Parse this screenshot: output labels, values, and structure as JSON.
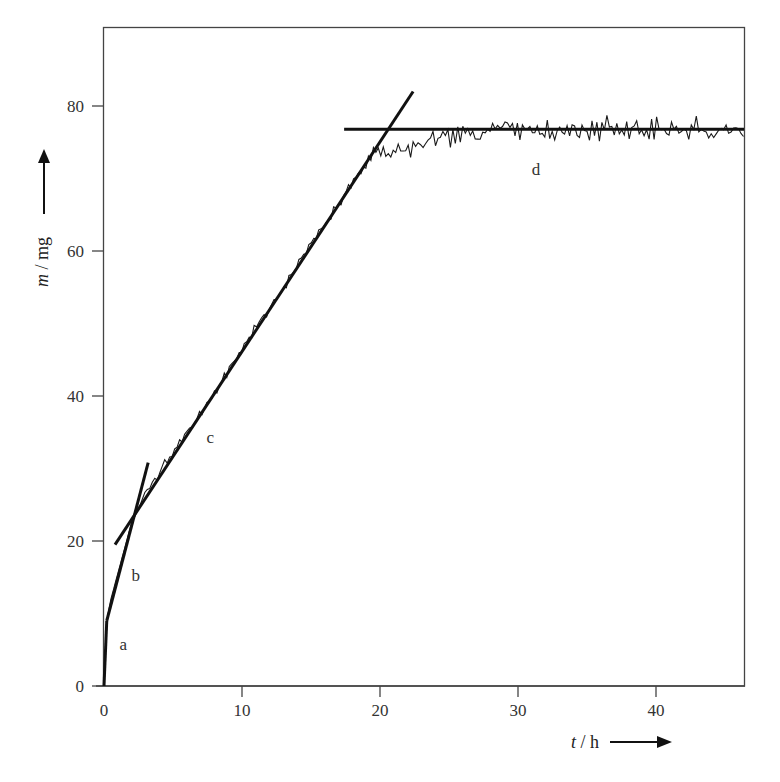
{
  "chart_data": {
    "type": "line",
    "title": "",
    "xlabel": "t / h",
    "ylabel": "m / mg",
    "xlabel_var": "t",
    "xlabel_unit": "h",
    "ylabel_var": "m",
    "ylabel_unit": "mg",
    "xlim": [
      0,
      46.4
    ],
    "ylim": [
      0,
      90.9
    ],
    "x_ticks": [
      0,
      10,
      20,
      30,
      40
    ],
    "y_ticks": [
      0,
      20,
      40,
      60,
      80
    ],
    "x_tick_labels": [
      "0",
      "10",
      "20",
      "30",
      "40"
    ],
    "y_tick_labels": [
      "0",
      "20",
      "40",
      "60",
      "80"
    ],
    "grid": false,
    "legend": null,
    "colors": {
      "line": "#1a1a1a",
      "axes": "#333333",
      "background": "#ffffff"
    },
    "series": [
      {
        "name": "measured mass (noisy)",
        "style": "thin",
        "description": "Noisy measured mass vs time: rapid rise (a), steep linear (b), linear ~2.9 mg/h (c), plateau ~76.7 mg (d)",
        "x": [
          0,
          0.2,
          0.5,
          1,
          1.5,
          2,
          2.5,
          3,
          4,
          5,
          6,
          7,
          8,
          9,
          10,
          11,
          12,
          13,
          14,
          15,
          16,
          17,
          18,
          19,
          19.5,
          20,
          21,
          22,
          23,
          24,
          25,
          26,
          27,
          28,
          30,
          32,
          34,
          36,
          38,
          40,
          42,
          44,
          46.4
        ],
        "y": [
          0,
          9,
          12,
          15.5,
          19,
          22.5,
          24.5,
          26.5,
          29.5,
          32,
          35,
          37.5,
          40.5,
          43.5,
          46.5,
          49.5,
          52,
          55,
          58,
          61,
          63.5,
          66.5,
          69.5,
          72,
          73.5,
          74,
          73.5,
          74,
          74.5,
          75.5,
          75.5,
          76,
          76.5,
          77,
          76.8,
          76.7,
          76.8,
          76.6,
          76.7,
          76.8,
          76.5,
          76.6,
          76.7
        ]
      },
      {
        "name": "fit line a",
        "style": "thick",
        "x": [
          0,
          0.2
        ],
        "y": [
          0,
          9
        ]
      },
      {
        "name": "fit line b",
        "style": "thick",
        "x": [
          0.2,
          3.2
        ],
        "y": [
          9,
          30.8
        ]
      },
      {
        "name": "fit line c",
        "style": "thick",
        "x": [
          0.8,
          22.4
        ],
        "y": [
          19.5,
          82
        ]
      },
      {
        "name": "fit line d",
        "style": "thick",
        "x": [
          17.4,
          46.4
        ],
        "y": [
          76.8,
          76.8
        ]
      }
    ],
    "annotations": [
      {
        "text": "a",
        "x": 1.4,
        "y": 5
      },
      {
        "text": "b",
        "x": 2.3,
        "y": 14.5
      },
      {
        "text": "c",
        "x": 7.7,
        "y": 33.5
      },
      {
        "text": "d",
        "x": 31.3,
        "y": 70.5
      }
    ],
    "noise": {
      "seed": 7,
      "step_h": 0.18,
      "amp_c": 0.9,
      "amp_d": 1.8
    }
  }
}
